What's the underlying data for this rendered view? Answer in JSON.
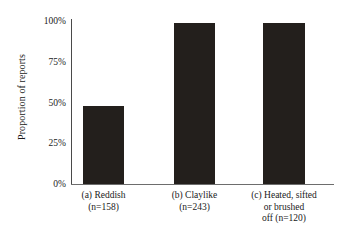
{
  "chart_data": {
    "type": "bar",
    "title": "",
    "xlabel": "",
    "ylabel": "Proportion of reports",
    "ylim": [
      0,
      100
    ],
    "yticks": [
      "0%",
      "25%",
      "50%",
      "75%",
      "100%"
    ],
    "ytick_values": [
      0,
      25,
      50,
      75,
      100
    ],
    "grid": false,
    "legend": "none",
    "bar_color": "#231f1c",
    "axis_color": "#4a4a4a",
    "categories": [
      "(a) Reddish\n(n=158)",
      "(b) Claylike\n(n=243)",
      "(c) Heated, sifted\nor brushed\noff (n=120)"
    ],
    "category_names": [
      "(a) Reddish",
      "(b) Claylike",
      "(c) Heated, sifted or brushed off"
    ],
    "category_counts": [
      158,
      243,
      120
    ],
    "values": [
      48,
      99,
      99
    ]
  }
}
